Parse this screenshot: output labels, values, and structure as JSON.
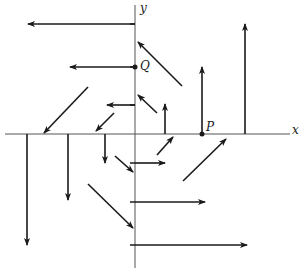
{
  "diagram": {
    "title": "",
    "type": "vector-field",
    "colors": {
      "ink": "#1a1a1a",
      "axis": "#555555",
      "background": "#ffffff"
    },
    "axes": {
      "x_label": "x",
      "y_label": "y",
      "origin_px": [
        135,
        134
      ]
    },
    "points": [
      {
        "name": "Q",
        "label": "Q",
        "px": [
          135,
          67
        ]
      },
      {
        "name": "P",
        "label": "P",
        "px": [
          202,
          134
        ]
      }
    ],
    "ticks_y_px": [
      24,
      67,
      105,
      163,
      202,
      245
    ],
    "ticks_x_px": [
      27,
      68,
      105,
      165,
      202,
      245
    ],
    "arrows": [
      {
        "from": [
          135,
          24
        ],
        "to": [
          28,
          24
        ]
      },
      {
        "from": [
          135,
          67
        ],
        "to": [
          70,
          67
        ]
      },
      {
        "from": [
          135,
          105
        ],
        "to": [
          107,
          105
        ]
      },
      {
        "from": [
          182,
          86
        ],
        "to": [
          138,
          42
        ]
      },
      {
        "from": [
          157,
          113
        ],
        "to": [
          138,
          95
        ]
      },
      {
        "from": [
          165,
          134
        ],
        "to": [
          165,
          104
        ]
      },
      {
        "from": [
          202,
          134
        ],
        "to": [
          202,
          67
        ]
      },
      {
        "from": [
          245,
          134
        ],
        "to": [
          245,
          24
        ]
      },
      {
        "from": [
          88,
          87
        ],
        "to": [
          44,
          133
        ]
      },
      {
        "from": [
          114,
          113
        ],
        "to": [
          96,
          131
        ]
      },
      {
        "from": [
          27,
          134
        ],
        "to": [
          27,
          245
        ]
      },
      {
        "from": [
          68,
          134
        ],
        "to": [
          68,
          200
        ]
      },
      {
        "from": [
          105,
          134
        ],
        "to": [
          105,
          163
        ]
      },
      {
        "from": [
          115,
          156
        ],
        "to": [
          133,
          172
        ]
      },
      {
        "from": [
          88,
          184
        ],
        "to": [
          133,
          228
        ]
      },
      {
        "from": [
          135,
          163
        ],
        "to": [
          165,
          163
        ]
      },
      {
        "from": [
          135,
          202
        ],
        "to": [
          205,
          202
        ]
      },
      {
        "from": [
          135,
          245
        ],
        "to": [
          247,
          245
        ]
      },
      {
        "from": [
          157,
          155
        ],
        "to": [
          173,
          137
        ]
      },
      {
        "from": [
          183,
          181
        ],
        "to": [
          226,
          139
        ]
      }
    ]
  }
}
